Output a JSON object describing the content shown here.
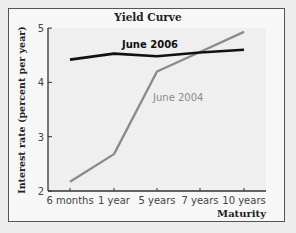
{
  "chart_data": {
    "type": "line",
    "title": "Yield Curve",
    "xlabel": "Maturity",
    "ylabel": "Interest rate (percent per year)",
    "categories": [
      "6 months",
      "1 year",
      "5 years",
      "7 years",
      "10 years"
    ],
    "ylim": [
      2,
      5
    ],
    "yticks": [
      "2",
      "3",
      "4",
      "5"
    ],
    "grid": false,
    "series": [
      {
        "name": "June 2006",
        "color": "#111111",
        "values": [
          4.42,
          4.53,
          4.48,
          4.55,
          4.6
        ]
      },
      {
        "name": "June 2004",
        "color": "#8a8a8a",
        "values": [
          2.17,
          2.68,
          4.2,
          4.56,
          4.93
        ]
      }
    ]
  }
}
